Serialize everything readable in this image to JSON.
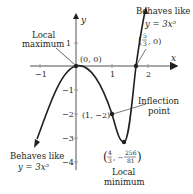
{
  "figure": {
    "axes": {
      "x_label": "x",
      "y_label": "y",
      "x_ticks": [
        {
          "value": -1,
          "label": "−1"
        },
        {
          "value": 1,
          "label": "1"
        },
        {
          "value": 2,
          "label": "2"
        }
      ],
      "y_ticks": [
        {
          "value": 1,
          "label": "1"
        },
        {
          "value": -1,
          "label": "−1"
        },
        {
          "value": -2,
          "label": "−2"
        },
        {
          "value": -3,
          "label": "−3"
        },
        {
          "value": -4,
          "label": "−4"
        }
      ]
    },
    "curve": {
      "equation": "y = 3x^5 - 5x^4",
      "color": "#231f20"
    },
    "points": {
      "local_max": {
        "coord_label": "(0, 0)",
        "annotation": "Local maximum",
        "line1": "Local",
        "line2": "maximum"
      },
      "root": {
        "coord_label": "(5/3, 0)",
        "num": "5",
        "den": "3",
        "tail": ", 0)"
      },
      "inflection": {
        "coord_label": "(1, −2)",
        "annotation_line1": "Inflection",
        "annotation_line2": "point"
      },
      "local_min": {
        "coord_label": "(4/3, −256/81)",
        "x_num": "4",
        "x_den": "3",
        "y_num": "256",
        "y_den": "81",
        "line1": "Local",
        "line2": "minimum"
      }
    },
    "end_behavior": {
      "right": {
        "line1": "Behaves like",
        "line2": "y = 3x⁵"
      },
      "left": {
        "line1": "Behaves like",
        "line2": "y = 3x⁵"
      }
    }
  }
}
